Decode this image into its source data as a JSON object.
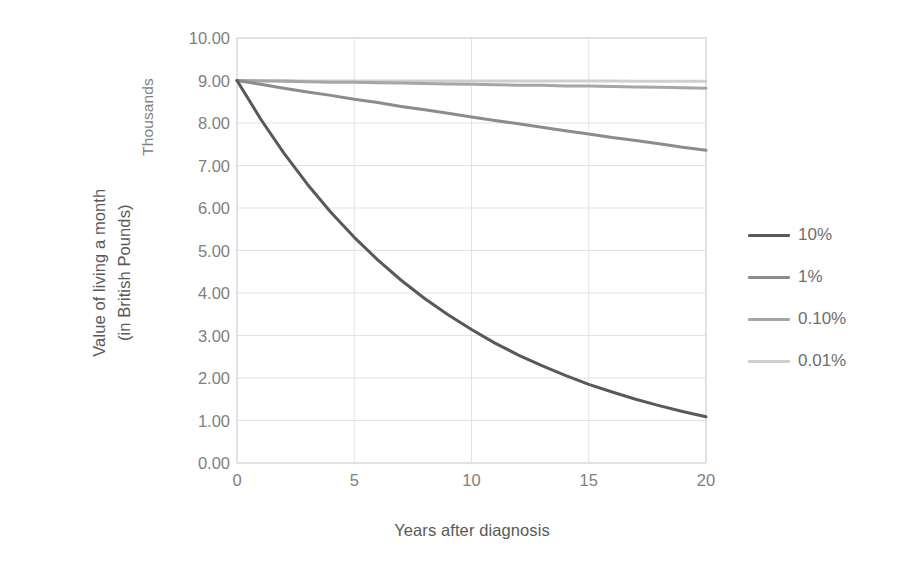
{
  "chart_data": {
    "type": "line",
    "title": "",
    "xlabel": "Years after diagnosis",
    "ylabel": "Value of living a month",
    "ylabel_line2": "(in British Pounds)",
    "y_units_label": "Thousands",
    "xlim": [
      0,
      20
    ],
    "ylim": [
      0,
      10
    ],
    "x_ticks": [
      "0",
      "5",
      "10",
      "15",
      "20"
    ],
    "x_tick_values": [
      0,
      5,
      10,
      15,
      20
    ],
    "y_ticks": [
      "0.00",
      "1.00",
      "2.00",
      "3.00",
      "4.00",
      "5.00",
      "6.00",
      "7.00",
      "8.00",
      "9.00",
      "10.00"
    ],
    "y_tick_values": [
      0,
      1,
      2,
      3,
      4,
      5,
      6,
      7,
      8,
      9,
      10
    ],
    "grid": true,
    "legend_position": "right",
    "x": [
      0,
      1,
      2,
      3,
      4,
      5,
      6,
      7,
      8,
      9,
      10,
      11,
      12,
      13,
      14,
      15,
      16,
      17,
      18,
      19,
      20
    ],
    "series": [
      {
        "name": "10%",
        "color": "#595959",
        "values": [
          9.0,
          8.1,
          7.29,
          6.56,
          5.9,
          5.31,
          4.78,
          4.3,
          3.87,
          3.49,
          3.14,
          2.82,
          2.54,
          2.29,
          2.06,
          1.85,
          1.67,
          1.5,
          1.35,
          1.21,
          1.09
        ]
      },
      {
        "name": "1%",
        "color": "#8c8c8c",
        "values": [
          9.0,
          8.91,
          8.82,
          8.73,
          8.65,
          8.56,
          8.48,
          8.39,
          8.31,
          8.23,
          8.14,
          8.06,
          7.98,
          7.9,
          7.82,
          7.74,
          7.66,
          7.59,
          7.51,
          7.43,
          7.36
        ]
      },
      {
        "name": "0.10%",
        "color": "#a6a6a6",
        "values": [
          9.0,
          8.99,
          8.98,
          8.97,
          8.96,
          8.96,
          8.95,
          8.94,
          8.93,
          8.92,
          8.91,
          8.9,
          8.89,
          8.89,
          8.87,
          8.87,
          8.86,
          8.85,
          8.84,
          8.83,
          8.82
        ]
      },
      {
        "name": "0.01%",
        "color": "#cfcfcf",
        "values": [
          9.0,
          9.0,
          9.0,
          8.99,
          8.99,
          8.99,
          8.99,
          8.99,
          8.99,
          8.99,
          8.99,
          8.99,
          8.99,
          8.99,
          8.99,
          8.99,
          8.99,
          8.98,
          8.98,
          8.98,
          8.98
        ]
      }
    ]
  },
  "legend": {
    "items": [
      {
        "label": "10%"
      },
      {
        "label": "1%"
      },
      {
        "label": "0.10%"
      },
      {
        "label": "0.01%"
      }
    ]
  },
  "colors": {
    "plot_border": "#d9d9d9",
    "gridline": "#e3e3e3",
    "tick_text": "#808080",
    "axis_title_text": "#595959"
  }
}
